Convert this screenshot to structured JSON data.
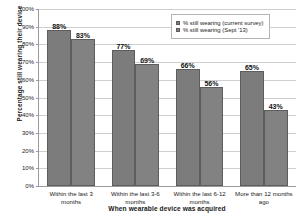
{
  "chart_data": {
    "type": "bar",
    "title": "",
    "xlabel": "When wearable device was acquired",
    "ylabel": "Percentage still wearing their device",
    "categories": [
      "Within the last 3 months",
      "Within the last 3-6 months",
      "Within the last 6-12 months",
      "More than 12 months ago"
    ],
    "category_lines": [
      [
        "Within the last 3",
        "months"
      ],
      [
        "Within the last 3-6",
        "months"
      ],
      [
        "Within the last 6-12",
        "months"
      ],
      [
        "More than 12 months",
        "ago"
      ]
    ],
    "series": [
      {
        "name": "% still wearing (current survey)",
        "color": "#7c7c7c",
        "values": [
          88,
          77,
          66,
          65
        ],
        "labels": [
          "88%",
          "77%",
          "66%",
          "65%"
        ]
      },
      {
        "name": "% still wearing (Sept '13)",
        "color": "#828282",
        "values": [
          83,
          69,
          56,
          43
        ],
        "labels": [
          "83%",
          "69%",
          "56%",
          "43%"
        ]
      }
    ],
    "ylim": [
      0,
      100
    ],
    "y_ticks": [
      0,
      10,
      20,
      30,
      40,
      50,
      60,
      70,
      80,
      90,
      100
    ],
    "y_tick_labels": [
      "0%",
      "10%",
      "20%",
      "30%",
      "40%",
      "50%",
      "60%",
      "70%",
      "80%",
      "90%",
      "100%"
    ],
    "grid": true,
    "legend_position": "top-right"
  },
  "legend": {
    "entries": [
      "% still wearing (current survey)",
      "% still wearing (Sept '13)"
    ]
  }
}
